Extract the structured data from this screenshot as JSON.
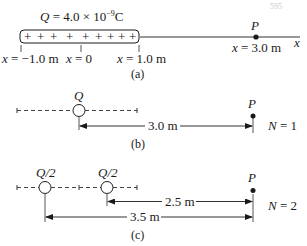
{
  "corner_label": "595",
  "panel_a": {
    "charge_label_Q": "Q",
    "charge_label_rest": " = 4.0 × 10",
    "charge_exp": "−9",
    "charge_unit": "C",
    "rod_signs": [
      "+",
      "+",
      "+",
      "+",
      "+",
      "+",
      "+",
      "+",
      "+"
    ],
    "point_label": "P",
    "axis_label": "x",
    "ticks": [
      {
        "var": "x",
        "text": " = −1.0 m"
      },
      {
        "var": "x",
        "text": " = 0"
      },
      {
        "var": "x",
        "text": " = 1.0 m"
      }
    ],
    "point_pos": {
      "var": "x",
      "text": " = 3.0 m"
    },
    "caption": "(a)"
  },
  "panel_b": {
    "charge_label": "Q",
    "point_label": "P",
    "distance": "3.0 m",
    "n_label_var": "N",
    "n_label_val": " = 1",
    "caption": "(b)"
  },
  "panel_c": {
    "charge_labels": [
      "Q/2",
      "Q/2"
    ],
    "point_label": "P",
    "distance_near": "2.5 m",
    "distance_far": "3.5 m",
    "n_label_var": "N",
    "n_label_val": " = 2",
    "caption": "(c)"
  }
}
